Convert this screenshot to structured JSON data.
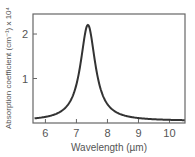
{
  "chart_data": {
    "type": "line",
    "title": "",
    "xlabel": "Wavelength (µm)",
    "ylabel": "Absorption coefficient (cm⁻¹) x 10⁴",
    "xlim": [
      5.6,
      10.5
    ],
    "ylim": [
      0,
      2.45
    ],
    "x_ticks": [
      6,
      7,
      8,
      9,
      10
    ],
    "y_ticks": [
      1,
      2
    ],
    "grid": false,
    "legend": null,
    "series": [
      {
        "name": "absorption",
        "color": "#333333",
        "x": [
          5.65,
          5.8,
          6.0,
          6.2,
          6.4,
          6.6,
          6.8,
          6.9,
          7.0,
          7.1,
          7.2,
          7.3,
          7.37,
          7.45,
          7.55,
          7.65,
          7.75,
          7.9,
          8.1,
          8.3,
          8.6,
          9.0,
          9.5,
          10.0,
          10.5
        ],
        "y": [
          0.06,
          0.07,
          0.1,
          0.13,
          0.18,
          0.28,
          0.48,
          0.68,
          0.99,
          1.43,
          1.9,
          2.18,
          2.22,
          2.1,
          1.6,
          1.08,
          0.74,
          0.45,
          0.27,
          0.18,
          0.12,
          0.08,
          0.06,
          0.05,
          0.04
        ]
      }
    ]
  },
  "axes": {
    "x_tick_labels": [
      "6",
      "7",
      "8",
      "9",
      "10"
    ],
    "y_tick_labels": [
      "1",
      "2"
    ],
    "xlabel": "Wavelength (µm)",
    "ylabel": "Absorption coefficient (cm⁻¹) x 10⁴"
  }
}
